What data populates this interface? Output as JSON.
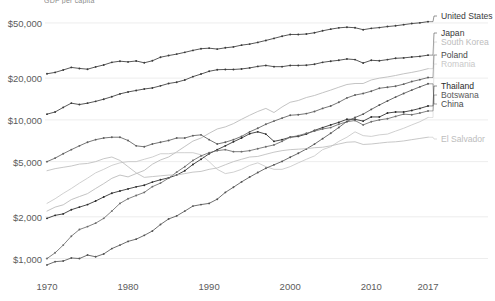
{
  "chart_title": "GDP per capita",
  "axes": {
    "y_label": "",
    "x_label": "",
    "y_ticks": [
      {
        "label": "$50,000",
        "value": 50000
      },
      {
        "label": "$20,000",
        "value": 20000
      },
      {
        "label": "$10,000",
        "value": 10000
      },
      {
        "label": "$5,000",
        "value": 5000
      },
      {
        "label": "$2,000",
        "value": 2000
      },
      {
        "label": "$1,000",
        "value": 1000
      }
    ],
    "x_ticks": [
      {
        "label": "1970",
        "value": 1970
      },
      {
        "label": "1980",
        "value": 1980
      },
      {
        "label": "1990",
        "value": 1990
      },
      {
        "label": "2000",
        "value": 2000
      },
      {
        "label": "2010",
        "value": 2010
      },
      {
        "label": "2017",
        "value": 2017
      }
    ]
  },
  "legend": [
    {
      "name": "United States",
      "color": "#3a3a3a"
    },
    {
      "name": "Japan",
      "color": "#3a3a3a"
    },
    {
      "name": "South Korea",
      "color": "#b8b8b8"
    },
    {
      "name": "Poland",
      "color": "#5e5e5e"
    },
    {
      "name": "Romania",
      "color": "#c8c8c8"
    },
    {
      "name": "Thailand",
      "color": "#2b2b2b"
    },
    {
      "name": "Botswana",
      "color": "#6b6b6b"
    },
    {
      "name": "China",
      "color": "#555555"
    },
    {
      "name": "El Salvador",
      "color": "#bdbdbd"
    }
  ],
  "chart_data": {
    "type": "line",
    "title": "GDP per capita",
    "xlabel": "",
    "ylabel": "",
    "yscale": "log",
    "ylim": [
      800,
      62000
    ],
    "xlim": [
      1970,
      2017
    ],
    "grid": true,
    "legend_position": "right",
    "markers": true,
    "x": [
      1970,
      1971,
      1972,
      1973,
      1974,
      1975,
      1976,
      1977,
      1978,
      1979,
      1980,
      1981,
      1982,
      1983,
      1984,
      1985,
      1986,
      1987,
      1988,
      1989,
      1990,
      1991,
      1992,
      1993,
      1994,
      1995,
      1996,
      1997,
      1998,
      1999,
      2000,
      2001,
      2002,
      2003,
      2004,
      2005,
      2006,
      2007,
      2008,
      2009,
      2010,
      2011,
      2012,
      2013,
      2014,
      2015,
      2016,
      2017
    ],
    "series": [
      {
        "name": "United States",
        "color": "#3a3a3a",
        "values": [
          21500,
          22000,
          22900,
          23900,
          23500,
          23200,
          24100,
          24900,
          26000,
          26500,
          26200,
          26600,
          25800,
          26700,
          28300,
          29100,
          29800,
          30700,
          31700,
          32600,
          32900,
          32400,
          33100,
          33600,
          34600,
          35200,
          36200,
          37400,
          38700,
          40100,
          41300,
          41300,
          41600,
          42500,
          43900,
          45100,
          46100,
          46600,
          46200,
          44700,
          45700,
          46300,
          47100,
          47700,
          48600,
          49500,
          50100,
          51100
        ]
      },
      {
        "name": "Japan",
        "color": "#3a3a3a",
        "values": [
          11000,
          11400,
          12300,
          13200,
          12900,
          13200,
          13600,
          14100,
          14700,
          15400,
          15900,
          16300,
          16700,
          17000,
          17600,
          18300,
          18700,
          19400,
          20500,
          21400,
          22400,
          23000,
          23100,
          23100,
          23300,
          23700,
          24300,
          24700,
          24200,
          24200,
          24700,
          24700,
          24800,
          25200,
          26000,
          26500,
          26900,
          27500,
          27200,
          25700,
          26900,
          26700,
          27200,
          27800,
          28000,
          28400,
          28700,
          29300
        ]
      },
      {
        "name": "South Korea",
        "color": "#b8b8b8",
        "values": [
          2200,
          2350,
          2440,
          2660,
          2800,
          2940,
          3200,
          3470,
          3790,
          4000,
          3880,
          4100,
          4320,
          4790,
          5140,
          5400,
          5880,
          6430,
          7030,
          7400,
          8000,
          8600,
          8900,
          9400,
          10100,
          10800,
          11500,
          12100,
          11300,
          12400,
          13400,
          13800,
          14500,
          15000,
          15700,
          16400,
          17200,
          18000,
          18300,
          18300,
          19400,
          20000,
          20400,
          20900,
          21500,
          22000,
          22600,
          23400
        ]
      },
      {
        "name": "Poland",
        "color": "#5e5e5e",
        "values": [
          5000,
          5300,
          5700,
          6100,
          6500,
          6900,
          7200,
          7400,
          7500,
          7500,
          7100,
          6500,
          6400,
          6700,
          6900,
          7100,
          7400,
          7400,
          7700,
          7800,
          7200,
          6700,
          6900,
          7200,
          7600,
          8200,
          8700,
          9300,
          9800,
          10300,
          10800,
          10900,
          11100,
          11500,
          12100,
          12600,
          13400,
          14400,
          15100,
          15500,
          16100,
          16900,
          17200,
          17500,
          18100,
          18900,
          19500,
          20200
        ]
      },
      {
        "name": "Romania",
        "color": "#c8c8c8",
        "values": [
          2500,
          2700,
          2950,
          3200,
          3500,
          3800,
          4150,
          4400,
          4700,
          4900,
          5000,
          5000,
          5200,
          5400,
          5700,
          5700,
          5800,
          5800,
          5800,
          5600,
          5000,
          4400,
          4100,
          4200,
          4400,
          4700,
          4900,
          4600,
          4400,
          4400,
          4600,
          4900,
          5200,
          5500,
          6100,
          6400,
          7000,
          7500,
          8200,
          7700,
          7600,
          7800,
          7900,
          8300,
          8700,
          9200,
          9700,
          10400
        ]
      },
      {
        "name": "Thailand",
        "color": "#2b2b2b",
        "values": [
          1950,
          2050,
          2100,
          2250,
          2350,
          2450,
          2600,
          2780,
          2960,
          3070,
          3180,
          3290,
          3380,
          3560,
          3700,
          3820,
          4000,
          4300,
          4770,
          5200,
          5700,
          6100,
          6500,
          6950,
          7400,
          7950,
          8200,
          7900,
          7000,
          7200,
          7500,
          7600,
          7900,
          8400,
          8800,
          9200,
          9600,
          10100,
          10100,
          9800,
          10500,
          10500,
          11200,
          11400,
          11400,
          11700,
          12100,
          12600
        ]
      },
      {
        "name": "Botswana",
        "color": "#6b6b6b",
        "values": [
          1000,
          1100,
          1250,
          1450,
          1620,
          1700,
          1800,
          1950,
          2200,
          2500,
          2700,
          2850,
          3000,
          3300,
          3500,
          3800,
          4200,
          4600,
          5100,
          5500,
          5800,
          6000,
          6100,
          5900,
          5900,
          6000,
          6200,
          6400,
          6600,
          7000,
          7500,
          7700,
          8000,
          8300,
          8600,
          8800,
          9300,
          9700,
          9900,
          9200,
          9700,
          10000,
          10200,
          10600,
          11000,
          10900,
          11200,
          11600
        ]
      },
      {
        "name": "China",
        "color": "#555555",
        "values": [
          900,
          950,
          960,
          1010,
          1000,
          1060,
          1030,
          1080,
          1180,
          1250,
          1330,
          1380,
          1470,
          1580,
          1760,
          1930,
          2030,
          2200,
          2390,
          2450,
          2500,
          2680,
          3000,
          3270,
          3570,
          3870,
          4170,
          4480,
          4740,
          5020,
          5380,
          5740,
          6170,
          6690,
          7320,
          8010,
          8820,
          9760,
          10400,
          11000,
          11900,
          12800,
          13700,
          14600,
          15500,
          16400,
          17300,
          18200
        ]
      },
      {
        "name": "El Salvador",
        "color": "#bdbdbd",
        "values": [
          4300,
          4450,
          4550,
          4650,
          4800,
          4850,
          5000,
          5250,
          5400,
          5100,
          4600,
          4150,
          3850,
          3900,
          3950,
          4000,
          4000,
          4100,
          4200,
          4250,
          4400,
          4500,
          4750,
          5000,
          5200,
          5400,
          5450,
          5650,
          5850,
          6000,
          6100,
          6150,
          6200,
          6300,
          6350,
          6500,
          6700,
          6900,
          6950,
          6650,
          6700,
          6800,
          6900,
          6950,
          7050,
          7200,
          7350,
          7500
        ]
      }
    ]
  },
  "label_positions": [
    {
      "name": "United States",
      "x": 441,
      "y": 16,
      "color": "#3a3a3a"
    },
    {
      "name": "Japan",
      "x": 441,
      "y": 33,
      "color": "#3a3a3a"
    },
    {
      "name": "South Korea",
      "x": 441,
      "y": 42,
      "color": "#bdbdbd"
    },
    {
      "name": "Poland",
      "x": 441,
      "y": 55,
      "color": "#4a4a4a"
    },
    {
      "name": "Romania",
      "x": 441,
      "y": 64,
      "color": "#c9c9c9"
    },
    {
      "name": "Thailand",
      "x": 441,
      "y": 86,
      "color": "#2b2b2b"
    },
    {
      "name": "Botswana",
      "x": 441,
      "y": 95,
      "color": "#5a5a5a"
    },
    {
      "name": "China",
      "x": 441,
      "y": 104,
      "color": "#4a4a4a"
    },
    {
      "name": "El Salvador",
      "x": 441,
      "y": 139,
      "color": "#bdbdbd"
    }
  ]
}
